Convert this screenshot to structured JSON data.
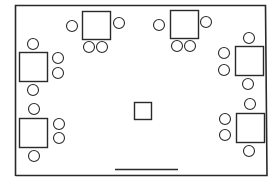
{
  "diagram": {
    "type": "floor-plan",
    "colors": {
      "line": "#2a2a2a",
      "background": "#ffffff"
    },
    "tables": [
      {
        "id": "table-top-left",
        "chairs": 4
      },
      {
        "id": "table-top-right",
        "chairs": 4
      },
      {
        "id": "table-left-upper",
        "chairs": 4
      },
      {
        "id": "table-left-lower",
        "chairs": 4
      },
      {
        "id": "table-right-upper",
        "chairs": 4
      },
      {
        "id": "table-right-lower",
        "chairs": 4
      }
    ],
    "center_object": "small-square",
    "door": "bottom-wall"
  }
}
